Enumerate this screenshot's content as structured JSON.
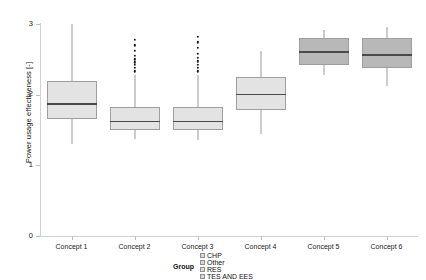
{
  "chart_data": {
    "type": "box",
    "title": "",
    "xlabel": "",
    "ylabel": "Power usage effectiveness [-]",
    "categories": [
      "Concept 1",
      "Concept 2",
      "Concept 3",
      "Concept 4",
      "Concept 5",
      "Concept 6"
    ],
    "ylim": [
      0,
      3.05
    ],
    "yticks": [
      0,
      1,
      2,
      3
    ],
    "ytick_labels": [
      "0",
      "1",
      "2",
      "3"
    ],
    "grid": false,
    "legend_position": "bottom",
    "boxes": [
      {
        "category": "Concept 1",
        "whisker_low": 1.3,
        "q1": 1.65,
        "median": 1.87,
        "q3": 2.2,
        "whisker_high": 3.0,
        "fill": "#e3e3e3",
        "outliers": []
      },
      {
        "category": "Concept 2",
        "whisker_low": 1.37,
        "q1": 1.5,
        "median": 1.62,
        "q3": 1.82,
        "whisker_high": 2.28,
        "fill": "#e3e3e3",
        "outliers": [
          2.33,
          2.38,
          2.42,
          2.46,
          2.5,
          2.55,
          2.62,
          2.7,
          2.78
        ]
      },
      {
        "category": "Concept 3",
        "whisker_low": 1.36,
        "q1": 1.5,
        "median": 1.62,
        "q3": 1.82,
        "whisker_high": 2.28,
        "fill": "#e3e3e3",
        "outliers": [
          2.33,
          2.38,
          2.42,
          2.47,
          2.52,
          2.58,
          2.66,
          2.74,
          2.82
        ]
      },
      {
        "category": "Concept 4",
        "whisker_low": 1.45,
        "q1": 1.78,
        "median": 2.0,
        "q3": 2.25,
        "whisker_high": 2.62,
        "fill": "#e3e3e3",
        "outliers": []
      },
      {
        "category": "Concept 5",
        "whisker_low": 2.28,
        "q1": 2.42,
        "median": 2.6,
        "q3": 2.8,
        "whisker_high": 2.92,
        "fill": "#b8b8b8",
        "outliers": []
      },
      {
        "category": "Concept 6",
        "whisker_low": 2.12,
        "q1": 2.38,
        "median": 2.56,
        "q3": 2.8,
        "whisker_high": 2.96,
        "fill": "#b8b8b8",
        "outliers": []
      }
    ]
  },
  "legend": {
    "title": "Group",
    "items": [
      {
        "label": "CHP",
        "color": "#d9d9d9"
      },
      {
        "label": "Other",
        "color": "#d9d9d9"
      },
      {
        "label": "RES",
        "color": "#d9d9d9"
      },
      {
        "label": "TES AND EES",
        "color": "#d9d9d9"
      }
    ]
  }
}
